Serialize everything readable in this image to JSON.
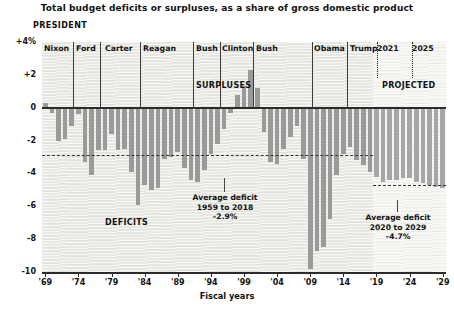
{
  "header": {
    "title": "Total budget deficits or surpluses, as a share of gross domestic product",
    "president_label": "PRESIDENT"
  },
  "axis": {
    "x_title": "Fiscal years",
    "y_ticks": [
      "+4%",
      "+2",
      "0",
      "-2",
      "-4",
      "-6",
      "-8",
      "-10"
    ],
    "x_ticks": [
      "'69",
      "'74",
      "'79",
      "'84",
      "'89",
      "'94",
      "'99",
      "'04",
      "'09",
      "'14",
      "'19",
      "'24",
      "'29"
    ]
  },
  "annotations": {
    "surpluses": "SURPLUSES",
    "deficits": "DEFICITS",
    "projected": "PROJECTED",
    "avg1_line1": "Average deficit",
    "avg1_line2": "1959 to 2018",
    "avg1_line3": "–2.9%",
    "avg2_line1": "Average deficit",
    "avg2_line2": "2020 to 2029",
    "avg2_line3": "–4.7%"
  },
  "presidents": [
    {
      "name": "Nixon",
      "label_x": 44,
      "divider_x": null,
      "dotted": false
    },
    {
      "name": "Ford",
      "label_x": 76,
      "divider_x": 73,
      "dotted": false
    },
    {
      "name": "Carter",
      "label_x": 105,
      "divider_x": 100,
      "dotted": false
    },
    {
      "name": "Reagan",
      "label_x": 143,
      "divider_x": 140,
      "dotted": false
    },
    {
      "name": "Bush",
      "label_x": 196,
      "divider_x": 193,
      "dotted": false
    },
    {
      "name": "Clinton",
      "label_x": 222,
      "divider_x": 220,
      "dotted": false
    },
    {
      "name": "Bush",
      "label_x": 256,
      "divider_x": 253,
      "dotted": false
    },
    {
      "name": "Obama",
      "label_x": 314,
      "divider_x": 312,
      "dotted": false
    },
    {
      "name": "Trump",
      "label_x": 350,
      "divider_x": 347,
      "dotted": false
    },
    {
      "name": "2021",
      "label_x": 377,
      "divider_x": 377,
      "dotted": true
    },
    {
      "name": "2025",
      "label_x": 412,
      "divider_x": 412,
      "dotted": true
    }
  ],
  "colors": {
    "bar": "#9a9a9a",
    "bar_projected": "#a6a6a6",
    "axis": "#2b2b2b",
    "plot_bg": "#e9e9e4",
    "projected_bg": "#f4f4f1"
  },
  "chart_data": {
    "type": "bar",
    "title": "Total budget deficits or surpluses, as a share of gross domestic product",
    "xlabel": "Fiscal years",
    "ylabel": "",
    "ylim": [
      -10,
      4
    ],
    "grid": false,
    "legend": "none",
    "projected_from": 2019,
    "reference_lines": [
      {
        "label": "Average deficit 1959 to 2018",
        "value": -2.9,
        "x_start": 1969,
        "x_end": 2019
      },
      {
        "label": "Average deficit 2020 to 2029",
        "value": -4.7,
        "x_start": 2019,
        "x_end": 2029
      }
    ],
    "x": [
      1969,
      1970,
      1971,
      1972,
      1973,
      1974,
      1975,
      1976,
      1977,
      1978,
      1979,
      1980,
      1981,
      1982,
      1983,
      1984,
      1985,
      1986,
      1987,
      1988,
      1989,
      1990,
      1991,
      1992,
      1993,
      1994,
      1995,
      1996,
      1997,
      1998,
      1999,
      2000,
      2001,
      2002,
      2003,
      2004,
      2005,
      2006,
      2007,
      2008,
      2009,
      2010,
      2011,
      2012,
      2013,
      2014,
      2015,
      2016,
      2017,
      2018,
      2019,
      2020,
      2021,
      2022,
      2023,
      2024,
      2025,
      2026,
      2027,
      2028,
      2029
    ],
    "values": [
      0.3,
      -0.3,
      -2.0,
      -1.9,
      -1.1,
      -0.4,
      -3.3,
      -4.1,
      -2.6,
      -2.6,
      -1.6,
      -2.6,
      -2.5,
      -3.9,
      -5.9,
      -4.7,
      -5.0,
      -4.9,
      -3.1,
      -3.0,
      -2.7,
      -3.7,
      -4.4,
      -4.5,
      -3.8,
      -2.8,
      -2.2,
      -1.3,
      -0.3,
      0.8,
      1.3,
      2.3,
      1.2,
      -1.5,
      -3.3,
      -3.4,
      -2.5,
      -1.8,
      -1.1,
      -3.1,
      -9.8,
      -8.7,
      -8.5,
      -6.8,
      -4.1,
      -2.8,
      -2.4,
      -3.2,
      -3.5,
      -3.9,
      -4.2,
      -4.5,
      -4.4,
      -4.4,
      -4.3,
      -4.3,
      -4.5,
      -4.6,
      -4.7,
      -4.8,
      -4.9
    ],
    "categories": [
      "1969",
      "1970",
      "1971",
      "1972",
      "1973",
      "1974",
      "1975",
      "1976",
      "1977",
      "1978",
      "1979",
      "1980",
      "1981",
      "1982",
      "1983",
      "1984",
      "1985",
      "1986",
      "1987",
      "1988",
      "1989",
      "1990",
      "1991",
      "1992",
      "1993",
      "1994",
      "1995",
      "1996",
      "1997",
      "1998",
      "1999",
      "2000",
      "2001",
      "2002",
      "2003",
      "2004",
      "2005",
      "2006",
      "2007",
      "2008",
      "2009",
      "2010",
      "2011",
      "2012",
      "2013",
      "2014",
      "2015",
      "2016",
      "2017",
      "2018",
      "2019",
      "2020",
      "2021",
      "2022",
      "2023",
      "2024",
      "2025",
      "2026",
      "2027",
      "2028",
      "2029"
    ]
  }
}
